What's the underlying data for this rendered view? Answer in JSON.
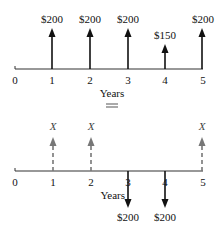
{
  "top_diagram": {
    "axis_label": "Years",
    "ticks": [
      "0",
      "1",
      "2",
      "3",
      "4",
      "5"
    ],
    "cash_flows": [
      {
        "year": "1",
        "label": "$200",
        "direction": "up"
      },
      {
        "year": "2",
        "label": "$200",
        "direction": "up"
      },
      {
        "year": "3",
        "label": "$200",
        "direction": "up"
      },
      {
        "year": "4",
        "label": "$150",
        "direction": "up"
      },
      {
        "year": "5",
        "label": "$200",
        "direction": "up"
      }
    ]
  },
  "equals_symbol": "=",
  "bottom_diagram": {
    "axis_label": "Years",
    "ticks": [
      "0",
      "1",
      "2",
      "3",
      "4",
      "5"
    ],
    "cash_flows": [
      {
        "year": "1",
        "label": "X",
        "direction": "up",
        "style": "dashed"
      },
      {
        "year": "2",
        "label": "X",
        "direction": "up",
        "style": "dashed"
      },
      {
        "year": "3",
        "label": "$200",
        "direction": "down"
      },
      {
        "year": "4",
        "label": "$200",
        "direction": "down"
      },
      {
        "year": "5",
        "label": "X",
        "direction": "up",
        "style": "dashed"
      }
    ]
  },
  "colors": {
    "solid": "#111111",
    "dashed": "#777777",
    "equals": "#aaaaaa"
  }
}
